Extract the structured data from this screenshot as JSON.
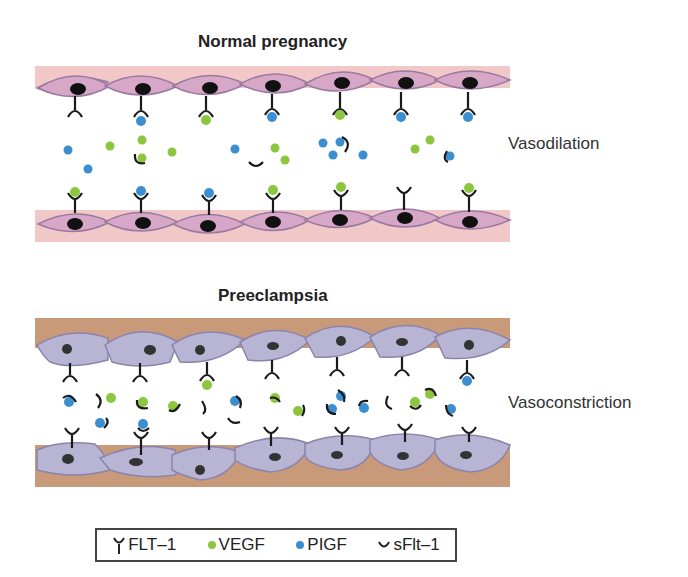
{
  "panels": {
    "normal": {
      "title": "Normal pregnancy",
      "outcome": "Vasodilation",
      "wall_color": "#f2c7c7",
      "cell_color": "#d7a7c8",
      "cell_stroke": "#9a7aa0",
      "nucleus_color": "#111111"
    },
    "preeclampsia": {
      "title": "Preeclampsia",
      "outcome": "Vasoconstriction",
      "wall_color": "#c99a7a",
      "cell_color": "#b8b4d4",
      "cell_stroke": "#8a84ac",
      "nucleus_color": "#333333"
    }
  },
  "legend": {
    "items": [
      {
        "icon": "flt1-receptor-icon",
        "label": "FLT–1"
      },
      {
        "icon": "vegf-dot-icon",
        "label": "VEGF",
        "color": "#8cc63f"
      },
      {
        "icon": "pigf-dot-icon",
        "label": "PIGF",
        "color": "#3b8fd0"
      },
      {
        "icon": "sflt1-arc-icon",
        "label": "sFlt–1"
      }
    ]
  },
  "colors": {
    "vegf": "#8cc63f",
    "pigf": "#3b8fd0",
    "receptor": "#1a1a1a"
  }
}
